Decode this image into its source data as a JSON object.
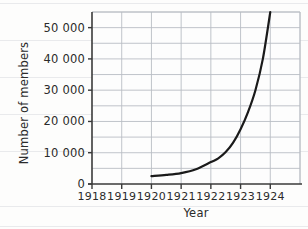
{
  "page": {
    "top_cut_text": "",
    "paper_rule_color": "#e9eaec"
  },
  "chart_data": {
    "type": "line",
    "title": "",
    "xlabel": "Year",
    "ylabel": "Number of members",
    "x": [
      1920,
      1920.5,
      1921,
      1921.5,
      1922,
      1922.25,
      1922.5,
      1922.75,
      1923,
      1923.25,
      1923.5,
      1923.75,
      1924
    ],
    "values": [
      2500,
      2900,
      3500,
      4700,
      7000,
      8200,
      10200,
      13200,
      17500,
      23000,
      30000,
      40000,
      55000
    ],
    "series": [
      {
        "name": "Number of members",
        "values": [
          2500,
          2900,
          3500,
          4700,
          7000,
          8200,
          10200,
          13200,
          17500,
          23000,
          30000,
          40000,
          55000
        ]
      }
    ],
    "xlim": [
      1918,
      1925
    ],
    "ylim": [
      0,
      55000
    ],
    "xticks": [
      1918,
      1919,
      1920,
      1921,
      1922,
      1923,
      1924
    ],
    "xtick_labels": [
      "1918",
      "1919",
      "1920",
      "1921",
      "1922",
      "1923",
      "1924"
    ],
    "yticks": [
      0,
      10000,
      20000,
      30000,
      40000,
      50000
    ],
    "ytick_labels": [
      "0",
      "10 000",
      "20 000",
      "30 000",
      "40 000",
      "50 000"
    ],
    "grid": true,
    "grid_color": "#b9bdc4",
    "line_color": "#1a1a1a",
    "line_width": 2.2,
    "axis_color": "#3a3a3a",
    "legend": null,
    "annotations": []
  },
  "axes": {
    "y_title": "Number of members",
    "x_title": "Year"
  }
}
